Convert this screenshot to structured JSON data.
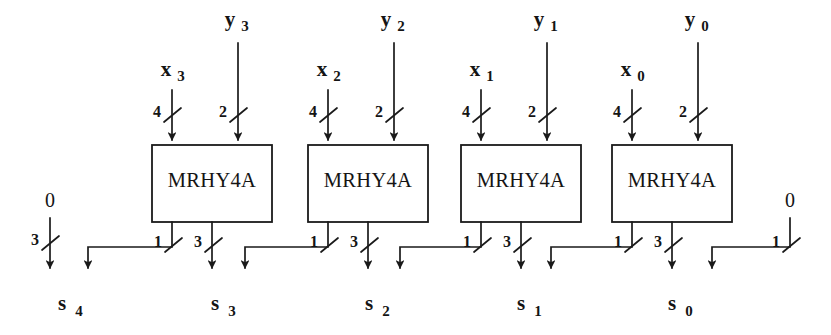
{
  "figure": {
    "block_label": "MRHY4A",
    "block_count": 4,
    "ink_color": "#1a1a1a",
    "background_color": "#ffffff"
  },
  "blocks": [
    {
      "label": "MRHY4A",
      "x_input": {
        "name": "x",
        "subscript": "3",
        "bus_width": "4"
      },
      "y_input": {
        "name": "y",
        "subscript": "3",
        "bus_width": "2"
      },
      "carry_out": {
        "bus_width": "1"
      },
      "sum_out": {
        "bus_width": "3"
      }
    },
    {
      "label": "MRHY4A",
      "x_input": {
        "name": "x",
        "subscript": "2",
        "bus_width": "4"
      },
      "y_input": {
        "name": "y",
        "subscript": "2",
        "bus_width": "2"
      },
      "carry_out": {
        "bus_width": "1"
      },
      "sum_out": {
        "bus_width": "3"
      }
    },
    {
      "label": "MRHY4A",
      "x_input": {
        "name": "x",
        "subscript": "1",
        "bus_width": "4"
      },
      "y_input": {
        "name": "y",
        "subscript": "1",
        "bus_width": "2"
      },
      "carry_out": {
        "bus_width": "1"
      },
      "sum_out": {
        "bus_width": "3"
      }
    },
    {
      "label": "MRHY4A",
      "x_input": {
        "name": "x",
        "subscript": "0",
        "bus_width": "4"
      },
      "y_input": {
        "name": "y",
        "subscript": "0",
        "bus_width": "2"
      },
      "carry_out": {
        "bus_width": "1"
      },
      "sum_out": {
        "bus_width": "3"
      }
    }
  ],
  "constants": {
    "left": {
      "value": "0",
      "bus_width": "3"
    },
    "right": {
      "value": "0",
      "bus_width": "1"
    }
  },
  "outputs": [
    {
      "name": "s",
      "subscript": "4"
    },
    {
      "name": "s",
      "subscript": "3"
    },
    {
      "name": "s",
      "subscript": "2"
    },
    {
      "name": "s",
      "subscript": "1"
    },
    {
      "name": "s",
      "subscript": "0"
    }
  ]
}
